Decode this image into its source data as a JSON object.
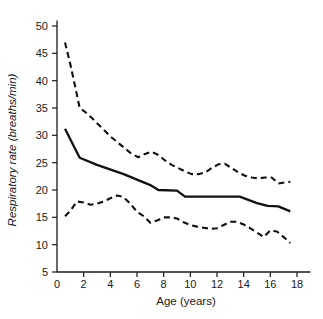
{
  "chart_data": {
    "type": "line",
    "title": "",
    "xlabel": "Age (years)",
    "ylabel": "Respiratory rate (breaths/min)",
    "xlim": [
      0,
      19
    ],
    "ylim": [
      5,
      51
    ],
    "xticks": [
      0,
      2,
      4,
      6,
      8,
      10,
      12,
      14,
      16,
      18
    ],
    "xtick_labels": [
      "0",
      "2",
      "4",
      "6",
      "8",
      "10",
      "12",
      "14",
      "16",
      "18"
    ],
    "yticks": [
      5,
      10,
      15,
      20,
      25,
      30,
      35,
      40,
      45,
      50
    ],
    "ytick_labels": [
      "5",
      "10",
      "15",
      "20",
      "25",
      "30",
      "35",
      "40",
      "45",
      "50"
    ],
    "grid": false,
    "legend": false,
    "line_color": "#111111",
    "series": [
      {
        "name": "upper centile",
        "style": "dashed",
        "x": [
          0.6,
          1.0,
          1.4,
          1.7,
          2.1,
          2.6,
          3.1,
          3.6,
          4.1,
          4.6,
          5.1,
          5.6,
          6.1,
          6.6,
          7.1,
          7.6,
          8.1,
          8.6,
          9.1,
          9.6,
          10.1,
          10.6,
          11.1,
          11.6,
          12.1,
          12.6,
          13.1,
          13.6,
          14.1,
          14.6,
          15.1,
          15.6,
          16.1,
          16.6,
          17.1,
          17.5
        ],
        "y": [
          47.0,
          43.0,
          38.5,
          35.0,
          34.3,
          33.2,
          32.0,
          30.8,
          29.6,
          28.6,
          27.6,
          26.6,
          26.0,
          26.6,
          27.0,
          26.4,
          25.4,
          24.6,
          24.0,
          23.4,
          22.9,
          22.9,
          23.2,
          24.0,
          24.7,
          24.8,
          24.0,
          23.2,
          22.6,
          22.3,
          22.1,
          22.3,
          22.3,
          21.2,
          21.4,
          21.5
        ]
      },
      {
        "name": "median",
        "style": "solid",
        "x": [
          0.6,
          1.7,
          3.0,
          5.0,
          7.0,
          7.6,
          9.0,
          9.6,
          11.0,
          13.0,
          13.7,
          15.0,
          15.8,
          16.6,
          17.5
        ],
        "y": [
          31.2,
          25.9,
          24.6,
          22.9,
          20.9,
          20.0,
          19.9,
          18.8,
          18.8,
          18.8,
          18.8,
          17.6,
          17.1,
          17.0,
          16.1
        ]
      },
      {
        "name": "lower centile",
        "style": "dashed",
        "x": [
          0.6,
          1.0,
          1.5,
          2.0,
          2.5,
          3.0,
          3.5,
          4.0,
          4.5,
          5.0,
          5.5,
          6.0,
          6.5,
          7.0,
          7.5,
          8.0,
          8.5,
          9.0,
          9.5,
          10.0,
          10.5,
          11.0,
          11.5,
          12.0,
          12.5,
          13.0,
          13.5,
          14.0,
          14.5,
          15.0,
          15.5,
          16.0,
          16.5,
          17.0,
          17.5
        ],
        "y": [
          15.2,
          16.2,
          17.9,
          17.7,
          17.3,
          17.5,
          17.9,
          18.5,
          19.0,
          18.7,
          17.5,
          16.0,
          15.2,
          14.0,
          14.4,
          15.0,
          15.0,
          14.8,
          14.1,
          13.6,
          13.3,
          13.1,
          12.9,
          13.0,
          13.6,
          14.2,
          14.2,
          13.7,
          13.0,
          12.2,
          11.4,
          12.6,
          12.4,
          11.4,
          10.3
        ]
      }
    ]
  }
}
